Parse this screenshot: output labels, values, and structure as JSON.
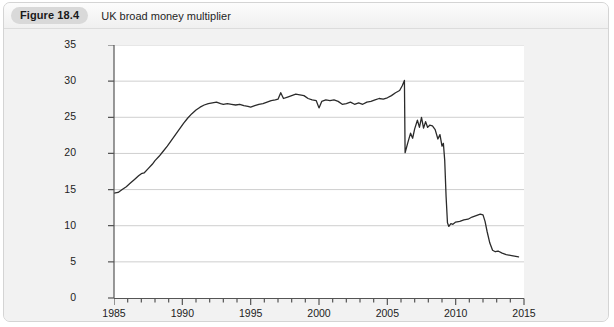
{
  "header": {
    "badge": "Figure 18.4",
    "title": "UK broad money multiplier"
  },
  "colors": {
    "panel_background": "#f2f2f2",
    "plot_background": "#ffffff",
    "line": "#2b2b2b",
    "gridline": "#cfcfcf",
    "axis": "#555555",
    "badge_background": "#d9d9d9",
    "text": "#1f1f1f"
  },
  "chart_data": {
    "type": "line",
    "title": "UK broad money multiplier",
    "xlabel": "",
    "ylabel": "",
    "xlim": [
      1985,
      2015
    ],
    "ylim": [
      0,
      35
    ],
    "grid": true,
    "legend": "none",
    "xticks": [
      1985,
      1990,
      1995,
      2000,
      2005,
      2010,
      2015
    ],
    "xtick_labels": [
      "1985",
      "1990",
      "1995",
      "2000",
      "2005",
      "2010",
      "2015"
    ],
    "x_minor_tick_interval": 1,
    "yticks": [
      0,
      5,
      10,
      15,
      20,
      25,
      30,
      35
    ],
    "ytick_labels": [
      "0",
      "5",
      "10",
      "15",
      "20",
      "25",
      "30",
      "35"
    ],
    "series": [
      {
        "name": "UK broad money multiplier",
        "color": "#2b2b2b",
        "points": [
          [
            1985.0,
            14.5
          ],
          [
            1985.3,
            14.6
          ],
          [
            1985.6,
            15.0
          ],
          [
            1985.9,
            15.4
          ],
          [
            1986.2,
            15.9
          ],
          [
            1986.5,
            16.4
          ],
          [
            1986.8,
            16.9
          ],
          [
            1987.0,
            17.2
          ],
          [
            1987.2,
            17.3
          ],
          [
            1987.5,
            17.9
          ],
          [
            1987.8,
            18.5
          ],
          [
            1988.0,
            19.0
          ],
          [
            1988.3,
            19.6
          ],
          [
            1988.6,
            20.3
          ],
          [
            1988.9,
            21.0
          ],
          [
            1989.2,
            21.8
          ],
          [
            1989.5,
            22.6
          ],
          [
            1989.8,
            23.4
          ],
          [
            1990.1,
            24.2
          ],
          [
            1990.4,
            24.9
          ],
          [
            1990.7,
            25.5
          ],
          [
            1991.0,
            26.0
          ],
          [
            1991.3,
            26.4
          ],
          [
            1991.6,
            26.7
          ],
          [
            1991.9,
            26.9
          ],
          [
            1992.2,
            27.0
          ],
          [
            1992.5,
            27.1
          ],
          [
            1992.8,
            26.9
          ],
          [
            1993.0,
            26.8
          ],
          [
            1993.3,
            26.9
          ],
          [
            1993.6,
            26.8
          ],
          [
            1993.9,
            26.7
          ],
          [
            1994.2,
            26.8
          ],
          [
            1994.5,
            26.6
          ],
          [
            1994.8,
            26.5
          ],
          [
            1995.0,
            26.4
          ],
          [
            1995.3,
            26.6
          ],
          [
            1995.6,
            26.8
          ],
          [
            1995.9,
            26.9
          ],
          [
            1996.2,
            27.1
          ],
          [
            1996.5,
            27.3
          ],
          [
            1996.8,
            27.4
          ],
          [
            1997.0,
            27.5
          ],
          [
            1997.2,
            28.4
          ],
          [
            1997.4,
            27.6
          ],
          [
            1997.7,
            27.8
          ],
          [
            1998.0,
            28.0
          ],
          [
            1998.3,
            28.2
          ],
          [
            1998.6,
            28.1
          ],
          [
            1998.9,
            28.0
          ],
          [
            1999.2,
            27.6
          ],
          [
            1999.5,
            27.4
          ],
          [
            1999.8,
            27.3
          ],
          [
            2000.0,
            26.3
          ],
          [
            2000.2,
            27.2
          ],
          [
            2000.5,
            27.4
          ],
          [
            2000.8,
            27.3
          ],
          [
            2001.1,
            27.4
          ],
          [
            2001.4,
            27.2
          ],
          [
            2001.7,
            26.8
          ],
          [
            2002.0,
            26.9
          ],
          [
            2002.3,
            27.1
          ],
          [
            2002.6,
            26.8
          ],
          [
            2002.9,
            27.0
          ],
          [
            2003.2,
            26.8
          ],
          [
            2003.5,
            27.1
          ],
          [
            2003.8,
            27.2
          ],
          [
            2004.1,
            27.4
          ],
          [
            2004.4,
            27.6
          ],
          [
            2004.7,
            27.5
          ],
          [
            2005.0,
            27.7
          ],
          [
            2005.3,
            28.0
          ],
          [
            2005.6,
            28.4
          ],
          [
            2005.9,
            28.7
          ],
          [
            2006.1,
            29.4
          ],
          [
            2006.25,
            30.1
          ],
          [
            2006.3,
            20.1
          ],
          [
            2006.5,
            21.5
          ],
          [
            2006.7,
            22.8
          ],
          [
            2006.85,
            22.1
          ],
          [
            2007.0,
            23.4
          ],
          [
            2007.2,
            24.6
          ],
          [
            2007.35,
            23.6
          ],
          [
            2007.5,
            25.0
          ],
          [
            2007.65,
            23.5
          ],
          [
            2007.8,
            24.4
          ],
          [
            2007.95,
            23.6
          ],
          [
            2008.1,
            23.9
          ],
          [
            2008.3,
            23.8
          ],
          [
            2008.5,
            23.3
          ],
          [
            2008.7,
            22.0
          ],
          [
            2008.85,
            22.6
          ],
          [
            2009.0,
            21.0
          ],
          [
            2009.1,
            21.4
          ],
          [
            2009.2,
            19.0
          ],
          [
            2009.3,
            14.0
          ],
          [
            2009.4,
            10.4
          ],
          [
            2009.5,
            9.9
          ],
          [
            2009.65,
            10.3
          ],
          [
            2009.8,
            10.2
          ],
          [
            2010.0,
            10.5
          ],
          [
            2010.3,
            10.6
          ],
          [
            2010.6,
            10.8
          ],
          [
            2010.9,
            10.9
          ],
          [
            2011.2,
            11.2
          ],
          [
            2011.5,
            11.4
          ],
          [
            2011.8,
            11.6
          ],
          [
            2012.0,
            11.5
          ],
          [
            2012.15,
            10.6
          ],
          [
            2012.3,
            9.2
          ],
          [
            2012.5,
            7.6
          ],
          [
            2012.7,
            6.6
          ],
          [
            2012.9,
            6.4
          ],
          [
            2013.1,
            6.5
          ],
          [
            2013.4,
            6.2
          ],
          [
            2013.7,
            6.0
          ],
          [
            2014.0,
            5.9
          ],
          [
            2014.3,
            5.8
          ],
          [
            2014.6,
            5.7
          ]
        ]
      }
    ]
  }
}
